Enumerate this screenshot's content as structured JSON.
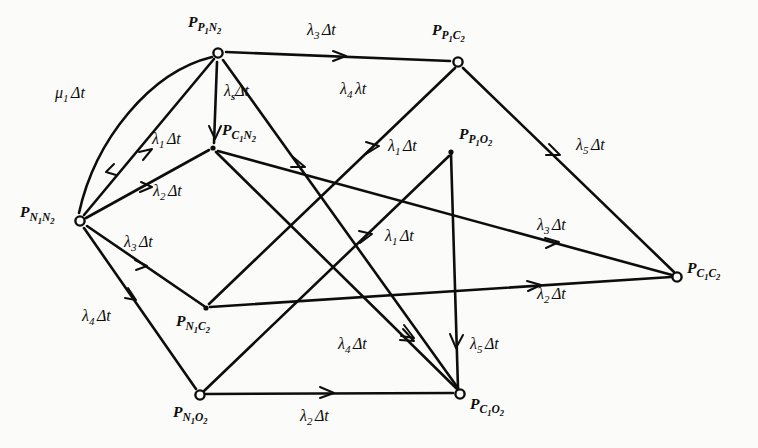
{
  "figure": {
    "type": "state-transition-diagram",
    "background_color": "#fbfbf9",
    "ink_color": "#0d0d0d"
  },
  "nodes": [
    {
      "id": "P1N2",
      "label_main": "P",
      "label_sub": "P",
      "label_sub_digit": "1",
      "label_sub2": "N",
      "label_sub2_digit": "2",
      "x": 218,
      "y": 53,
      "marker": "circle",
      "label_x": 188,
      "label_y": 14
    },
    {
      "id": "P1C2",
      "label_main": "P",
      "label_sub": "P",
      "label_sub_digit": "1",
      "label_sub2": "C",
      "label_sub2_digit": "2",
      "x": 458,
      "y": 62,
      "marker": "circle",
      "label_x": 432,
      "label_y": 22
    },
    {
      "id": "C1N2",
      "label_main": "P",
      "label_sub": "C",
      "label_sub_digit": "1",
      "label_sub2": "N",
      "label_sub2_digit": "2",
      "x": 213,
      "y": 148,
      "marker": "junction",
      "label_x": 222,
      "label_y": 122
    },
    {
      "id": "P1O2",
      "label_main": "P",
      "label_sub": "P",
      "label_sub_digit": "1",
      "label_sub2": "O",
      "label_sub2_digit": "2",
      "x": 451,
      "y": 152,
      "marker": "junction",
      "label_x": 459,
      "label_y": 126
    },
    {
      "id": "N1N2",
      "label_main": "P",
      "label_sub": "N",
      "label_sub_digit": "1",
      "label_sub2": "N",
      "label_sub2_digit": "2",
      "x": 80,
      "y": 221,
      "marker": "circle",
      "label_x": 20,
      "label_y": 204
    },
    {
      "id": "C1C2",
      "label_main": "P",
      "label_sub": "C",
      "label_sub_digit": "1",
      "label_sub2": "C",
      "label_sub2_digit": "2",
      "x": 677,
      "y": 277,
      "marker": "circle",
      "label_x": 687,
      "label_y": 260
    },
    {
      "id": "N1C2",
      "label_main": "P",
      "label_sub": "N",
      "label_sub_digit": "1",
      "label_sub2": "C",
      "label_sub2_digit": "2",
      "x": 206,
      "y": 308,
      "marker": "junction",
      "label_x": 176,
      "label_y": 313
    },
    {
      "id": "N1O2",
      "label_main": "P",
      "label_sub": "N",
      "label_sub_digit": "1",
      "label_sub2": "O",
      "label_sub2_digit": "2",
      "x": 200,
      "y": 395,
      "marker": "circle",
      "label_x": 173,
      "label_y": 404
    },
    {
      "id": "C1O2",
      "label_main": "P",
      "label_sub": "C",
      "label_sub_digit": "1",
      "label_sub2": "O",
      "label_sub2_digit": "2",
      "x": 460,
      "y": 394,
      "marker": "circle",
      "label_x": 470,
      "label_y": 396
    }
  ],
  "edges": [
    {
      "id": "e-mu1",
      "from": "P1N2",
      "to": "N1N2",
      "rate_greek": "μ",
      "rate_sub": "1",
      "rate_tail": "Δt",
      "curved": true,
      "label_x": 55,
      "label_y": 85
    },
    {
      "id": "e-l1-n1n2-p1n2",
      "from": "N1N2",
      "to": "P1N2",
      "rate_greek": "λ",
      "rate_sub": "1",
      "rate_tail": "Δt",
      "curved": false,
      "label_x": 152,
      "label_y": 131
    },
    {
      "id": "e-l2-n1n2-c1n2",
      "from": "N1N2",
      "to": "C1N2",
      "rate_greek": "λ",
      "rate_sub": "2",
      "rate_tail": "Δt",
      "curved": false,
      "label_x": 153,
      "label_y": 183
    },
    {
      "id": "e-l3-n1n2-n1c2",
      "from": "N1N2",
      "to": "N1C2",
      "rate_greek": "λ",
      "rate_sub": "3",
      "rate_tail": "Δt",
      "curved": false,
      "label_x": 124,
      "label_y": 234
    },
    {
      "id": "e-l4-n1n2-n1o2",
      "from": "N1N2",
      "to": "N1O2",
      "rate_greek": "λ",
      "rate_sub": "4",
      "rate_tail": "Δt",
      "curved": false,
      "label_x": 82,
      "label_y": 308
    },
    {
      "id": "e-ls-p1n2-c1n2",
      "from": "P1N2",
      "to": "C1N2",
      "rate_greek": "λ",
      "rate_sub": "s",
      "rate_tail": "Δt",
      "curved": false,
      "label_x": 224,
      "label_y": 83
    },
    {
      "id": "e-l3-p1n2-p1c2",
      "from": "P1N2",
      "to": "P1C2",
      "rate_greek": "λ",
      "rate_sub": "3",
      "rate_tail": "Δt",
      "curved": false,
      "label_x": 307,
      "label_y": 22
    },
    {
      "id": "e-l4-p1n2-c1o2",
      "from": "P1N2",
      "to": "C1O2",
      "rate_greek": "λ",
      "rate_sub": "4",
      "rate_tail": "λt",
      "curved": false,
      "label_x": 340,
      "label_y": 81
    },
    {
      "id": "e-l1-n1c2-p1c2",
      "from": "N1C2",
      "to": "P1C2",
      "rate_greek": "λ",
      "rate_sub": "1",
      "rate_tail": "Δt",
      "curved": false,
      "label_x": 388,
      "label_y": 138
    },
    {
      "id": "e-l1-n1o2-p1o2",
      "from": "N1O2",
      "to": "P1O2",
      "rate_greek": "λ",
      "rate_sub": "1",
      "rate_tail": "Δt",
      "curved": false,
      "label_x": 385,
      "label_y": 228
    },
    {
      "id": "e-l4-c1n2-c1o2",
      "from": "C1N2",
      "to": "C1O2",
      "rate_greek": "λ",
      "rate_sub": "4",
      "rate_tail": "Δt",
      "curved": false,
      "label_x": 338,
      "label_y": 336
    },
    {
      "id": "e-l5-p1c2-c1c2",
      "from": "P1C2",
      "to": "C1C2",
      "rate_greek": "λ",
      "rate_sub": "5",
      "rate_tail": "Δt",
      "curved": false,
      "label_x": 576,
      "label_y": 137
    },
    {
      "id": "e-l3-c1n2-c1c2",
      "from": "C1N2",
      "to": "C1C2",
      "rate_greek": "λ",
      "rate_sub": "3",
      "rate_tail": "Δt",
      "curved": false,
      "label_x": 537,
      "label_y": 217
    },
    {
      "id": "e-l2-n1c2-c1c2",
      "from": "N1C2",
      "to": "C1C2",
      "rate_greek": "λ",
      "rate_sub": "2",
      "rate_tail": "Δt",
      "curved": false,
      "label_x": 537,
      "label_y": 286
    },
    {
      "id": "e-l5-p1o2-c1o2",
      "from": "P1O2",
      "to": "C1O2",
      "rate_greek": "λ",
      "rate_sub": "5",
      "rate_tail": "Δt",
      "curved": false,
      "label_x": 470,
      "label_y": 336
    },
    {
      "id": "e-l2-n1o2-c1o2",
      "from": "N1O2",
      "to": "C1O2",
      "rate_greek": "λ",
      "rate_sub": "2",
      "rate_tail": "Δt",
      "curved": false,
      "label_x": 300,
      "label_y": 408
    }
  ]
}
